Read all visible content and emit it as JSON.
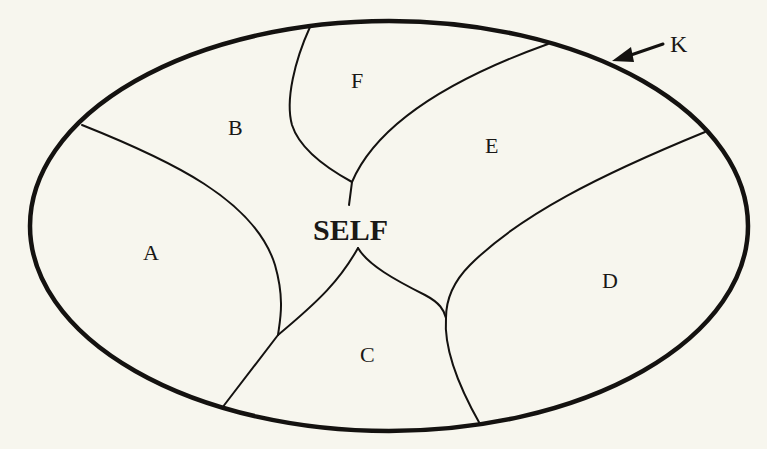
{
  "diagram": {
    "type": "region-map",
    "boundary_label": "K",
    "center_label": "SELF",
    "regions": [
      {
        "id": "A",
        "label": "A"
      },
      {
        "id": "B",
        "label": "B"
      },
      {
        "id": "C",
        "label": "C"
      },
      {
        "id": "D",
        "label": "D"
      },
      {
        "id": "E",
        "label": "E"
      },
      {
        "id": "F",
        "label": "F"
      }
    ],
    "colors": {
      "background": "#f7f6ee",
      "ink": "#141210"
    }
  }
}
